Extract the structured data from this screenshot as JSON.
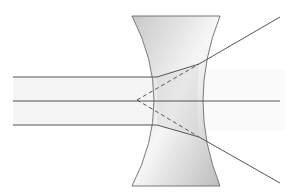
{
  "diagram": {
    "colors": {
      "background": "#ffffff",
      "ray": "#555555",
      "lens_fill_light": "#f4f4f4",
      "lens_fill_dark": "#bdbdbd",
      "lens_stroke": "#6a6a6a",
      "beam_band": "#f3f3f3"
    },
    "lens": {
      "type": "biconcave",
      "top_y": 16,
      "bottom_y": 186,
      "top_left_x": 132,
      "top_right_x": 220,
      "bottom_left_x": 132,
      "bottom_right_x": 220,
      "waist_left_x": 157,
      "waist_right_x": 194
    },
    "rays": [
      {
        "name": "upper-ray",
        "points": [
          [
            13,
            77
          ],
          [
            157,
            77
          ],
          [
            199,
            64
          ],
          [
            280,
            17
          ]
        ]
      },
      {
        "name": "axis-ray",
        "points": [
          [
            13,
            101
          ],
          [
            280,
            101
          ]
        ]
      },
      {
        "name": "lower-ray",
        "points": [
          [
            13,
            125
          ],
          [
            157,
            125
          ],
          [
            199,
            137
          ],
          [
            280,
            183
          ]
        ]
      }
    ],
    "virtual_rays": [
      {
        "name": "virtual-upper",
        "points": [
          [
            137,
            100
          ],
          [
            199,
            64
          ]
        ]
      },
      {
        "name": "virtual-lower",
        "points": [
          [
            137,
            100
          ],
          [
            199,
            137
          ]
        ]
      }
    ],
    "virtual_focus": [
      137,
      100
    ]
  }
}
